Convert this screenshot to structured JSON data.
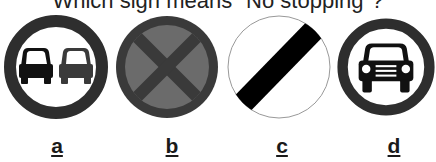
{
  "question": {
    "text": "Which sign means \"No stopping\"?"
  },
  "options": [
    {
      "label": "a",
      "icon": "no-overtaking-sign-icon",
      "description": "Red ring with two cars side by side"
    },
    {
      "label": "b",
      "icon": "no-stopping-clearway-sign-icon",
      "description": "Blue disc with red ring and red X cross"
    },
    {
      "label": "c",
      "icon": "national-speed-limit-sign-icon",
      "description": "White disc with black diagonal bar"
    },
    {
      "label": "d",
      "icon": "no-motor-vehicles-sign-icon",
      "description": "Red ring with front view of a car"
    }
  ],
  "colors": {
    "ring": "#333333",
    "disc_b": "#6b6b6b",
    "bar": "#000000"
  }
}
